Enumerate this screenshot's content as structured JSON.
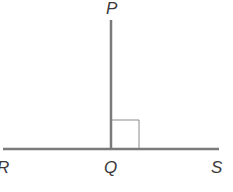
{
  "diagram": {
    "type": "geometry",
    "points": {
      "P": {
        "label": "P",
        "x": 111,
        "y": 20
      },
      "Q": {
        "label": "Q",
        "x": 111,
        "y": 149
      },
      "R": {
        "label": "R",
        "x": 3,
        "y": 149
      },
      "S": {
        "label": "S",
        "x": 219,
        "y": 149
      }
    },
    "labels": {
      "P": "P",
      "Q": "Q",
      "R": "R",
      "S": "S"
    },
    "right_angle_marker": {
      "at": "Q",
      "size": 28
    },
    "colors": {
      "line": "#7a7a7a",
      "marker": "#8a8a8a",
      "text": "#3a3a3a"
    }
  }
}
